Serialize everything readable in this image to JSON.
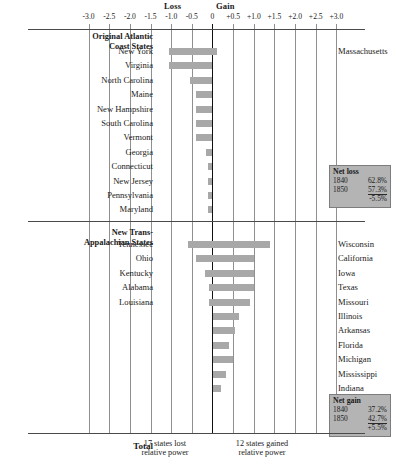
{
  "axis": {
    "loss_label": "Loss",
    "gain_label": "Gain",
    "ticks": [
      "-3.0",
      "-2.5",
      "-2.0",
      "-1.5",
      "-1.0",
      "-0.5",
      "0",
      "+0.5",
      "+1.0",
      "+1.5",
      "+2.0",
      "+2.5",
      "+3.0"
    ],
    "tick_values": [
      -3.0,
      -2.5,
      -2.0,
      -1.5,
      -1.0,
      -0.5,
      0,
      0.5,
      1.0,
      1.5,
      2.0,
      2.5,
      3.0
    ]
  },
  "sections": {
    "atlantic": {
      "title_line1": "Original Atlantic",
      "title_line2": "Coast States",
      "netbox": {
        "title": "Net loss",
        "rows": [
          {
            "year": "1840",
            "value": "62.8%"
          },
          {
            "year": "1850",
            "value": "57.3%"
          }
        ],
        "total": "-5.5%"
      }
    },
    "transapp": {
      "title_line1": "New Trans-",
      "title_line2": "Appalachian States",
      "netbox": {
        "title": "Net gain",
        "rows": [
          {
            "year": "1840",
            "value": "37.2%"
          },
          {
            "year": "1850",
            "value": "42.7%"
          }
        ],
        "total": "+5.5%"
      }
    }
  },
  "footer": {
    "total_label": "Total",
    "loss_note_line1": "17 states lost",
    "loss_note_line2": "relative power",
    "gain_note_line1": "12 states gained",
    "gain_note_line2": "relative power"
  },
  "chart_data": {
    "type": "bar",
    "xlabel": "",
    "ylabel": "",
    "xlim": [
      -3.0,
      3.0
    ],
    "grid": true,
    "orientation": "horizontal",
    "legend": "none",
    "series": [
      {
        "name": "Original Atlantic Coast States",
        "left_labels": [
          "New York",
          "Virginia",
          "North Carolina",
          "Maine",
          "New Hampshire",
          "South Carolina",
          "Vermont",
          "Georgia",
          "Connecticut",
          "New Jersey",
          "Pennsylvania",
          "Maryland"
        ],
        "right_labels": [
          "Massachusetts",
          "",
          "",
          "",
          "",
          "",
          "",
          "",
          "",
          "",
          "",
          ""
        ],
        "bar_start": [
          -1.05,
          -1.05,
          -0.55,
          -0.4,
          -0.4,
          -0.4,
          -0.4,
          -0.16,
          -0.1,
          -0.1,
          -0.1,
          -0.1
        ],
        "bar_end": [
          0.12,
          0.0,
          0.0,
          0.0,
          0.0,
          0.0,
          0.0,
          0.0,
          0.0,
          0.0,
          0.0,
          0.0
        ]
      },
      {
        "name": "New Trans-Appalachian States",
        "left_labels": [
          "Tennessee",
          "Ohio",
          "Kentucky",
          "Alabama",
          "Louisiana",
          "",
          "",
          "",
          "",
          "",
          ""
        ],
        "right_labels": [
          "Wisconsin",
          "California",
          "Iowa",
          "Texas",
          "Missouri",
          "Illinois",
          "Arkansas",
          "Florida",
          "Michigan",
          "Mississippi",
          "Indiana"
        ],
        "bar_start": [
          -0.6,
          -0.4,
          -0.18,
          -0.08,
          -0.08,
          0.0,
          0.0,
          0.0,
          0.0,
          0.0,
          0.0
        ],
        "bar_end": [
          1.4,
          1.0,
          1.0,
          1.0,
          0.9,
          0.65,
          0.55,
          0.4,
          0.5,
          0.33,
          0.2
        ]
      }
    ]
  }
}
